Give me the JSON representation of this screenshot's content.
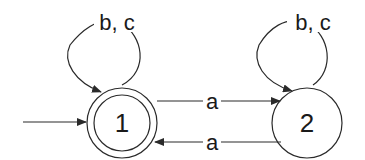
{
  "diagram": {
    "type": "finite-automaton",
    "colors": {
      "stroke": "#2a2a2a",
      "text": "#1a1a1a",
      "background": "#ffffff"
    },
    "states": [
      {
        "id": "1",
        "label": "1",
        "initial": true,
        "accepting": true
      },
      {
        "id": "2",
        "label": "2",
        "initial": false,
        "accepting": false
      }
    ],
    "transitions": [
      {
        "from": "1",
        "to": "1",
        "label": "b, c"
      },
      {
        "from": "1",
        "to": "2",
        "label": "a"
      },
      {
        "from": "2",
        "to": "1",
        "label": "a"
      },
      {
        "from": "2",
        "to": "2",
        "label": "b, c"
      }
    ]
  }
}
